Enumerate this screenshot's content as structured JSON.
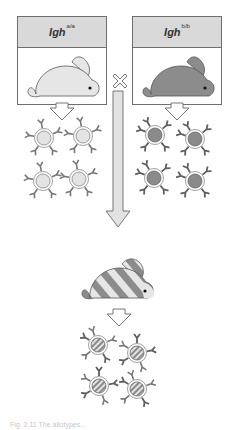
{
  "diagram": {
    "type": "allotype inheritance cross",
    "parents": [
      {
        "id": "parent-aa",
        "gene": "Igh",
        "genotype": "a/a",
        "rabbit_color": "#e6e6e6",
        "cell_fill": "#e3e3e3",
        "cell_pattern": "solid-light"
      },
      {
        "id": "parent-bb",
        "gene": "Igh",
        "genotype": "b/b",
        "rabbit_color": "#8c8c8c",
        "cell_fill": "#8a8a8a",
        "cell_pattern": "solid-dark"
      }
    ],
    "cross_symbol": "✕",
    "offspring": {
      "id": "offspring-ab",
      "gene": "Igh",
      "genotype": "a/b",
      "rabbit_pattern": "striped light/dark",
      "cell_pattern": "striped"
    },
    "colors": {
      "header_bg": "#d9d9d9",
      "border": "#6f6f6f",
      "light": "#e6e6e6",
      "dark": "#8c8c8c",
      "arrow_fill": "#e2e2e2"
    }
  },
  "caption": "Fig. 2.11  The allotypes..."
}
